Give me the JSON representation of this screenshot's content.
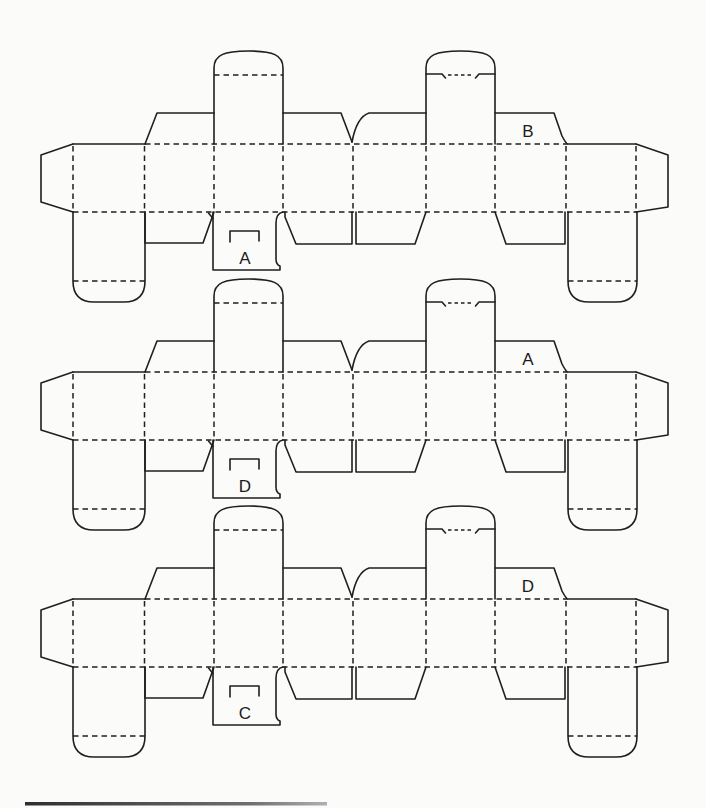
{
  "diagram": {
    "blanks": [
      {
        "name": "blank-1",
        "panel_letter": "B",
        "tab_letter": "A"
      },
      {
        "name": "blank-2",
        "panel_letter": "A",
        "tab_letter": "D"
      },
      {
        "name": "blank-3",
        "panel_letter": "D",
        "tab_letter": "C"
      }
    ],
    "colors": {
      "line": "#1f1f1f",
      "background": "#fbfbf9",
      "rule_dark": "#2e2e2e",
      "rule_light": "#b0b0b0"
    }
  }
}
